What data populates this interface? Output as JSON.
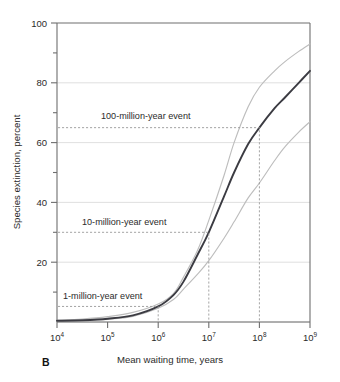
{
  "panel": {
    "label": "B"
  },
  "chart_data": {
    "type": "line",
    "title": "",
    "xlabel": "Mean waiting time, years",
    "ylabel": "Species extinction, percent",
    "xscale": "log",
    "xlim": [
      10000,
      1000000000
    ],
    "ylim": [
      0,
      100
    ],
    "grid": "horizontal-major",
    "legend": "none",
    "xticks": [
      {
        "value": 10000,
        "label": "10",
        "exponent": "4"
      },
      {
        "value": 100000,
        "label": "10",
        "exponent": "5"
      },
      {
        "value": 1000000,
        "label": "10",
        "exponent": "6"
      },
      {
        "value": 10000000,
        "label": "10",
        "exponent": "7"
      },
      {
        "value": 100000000,
        "label": "10",
        "exponent": "8"
      },
      {
        "value": 1000000000,
        "label": "10",
        "exponent": "9"
      }
    ],
    "yticks_major": [
      0,
      20,
      40,
      60,
      80,
      100
    ],
    "ytick_labels": [
      "",
      "20",
      "40",
      "60",
      "80",
      "100"
    ],
    "yticks_minor": [
      10,
      30,
      50,
      70,
      90
    ],
    "series": [
      {
        "name": "upper-bound",
        "style": "light-gray-thin",
        "color": "#bdbdbd",
        "x": [
          10000,
          31623,
          100000,
          316228,
          1000000,
          2000000,
          3162278,
          6000000,
          10000000,
          20000000,
          31622777,
          60000000,
          100000000,
          200000000,
          316227766,
          600000000,
          1000000000
        ],
        "y": [
          0.6,
          1.0,
          1.8,
          3.2,
          6.0,
          9.5,
          15.0,
          24.0,
          34.0,
          49.0,
          60.0,
          72.0,
          78.5,
          84.0,
          87.0,
          90.5,
          93.0
        ]
      },
      {
        "name": "best-estimate",
        "style": "dark-thick",
        "color": "#3b3b42",
        "x": [
          10000,
          31623,
          100000,
          316228,
          1000000,
          2000000,
          3162278,
          6000000,
          10000000,
          20000000,
          31622777,
          60000000,
          100000000,
          200000000,
          316227766,
          600000000,
          1000000000
        ],
        "y": [
          0.4,
          0.6,
          1.1,
          2.2,
          5.2,
          9.0,
          13.5,
          22.5,
          30.0,
          42.0,
          50.0,
          59.5,
          65.0,
          71.5,
          75.0,
          80.0,
          84.0
        ]
      },
      {
        "name": "lower-bound",
        "style": "light-gray-thin",
        "color": "#c6c6c6",
        "x": [
          10000,
          31623,
          100000,
          316228,
          1000000,
          2000000,
          3162278,
          6000000,
          10000000,
          20000000,
          31622777,
          60000000,
          100000000,
          200000000,
          316227766,
          600000000,
          1000000000
        ],
        "y": [
          0.3,
          0.5,
          0.9,
          1.9,
          4.6,
          7.5,
          11.0,
          16.0,
          20.5,
          28.0,
          33.5,
          41.5,
          46.5,
          54.0,
          58.5,
          63.5,
          67.0
        ]
      }
    ],
    "annotations": [
      {
        "name": "100-million-year-event",
        "text": "100-million-year event",
        "x": 100000000,
        "y": 65.0,
        "leader": "elbow-left-down"
      },
      {
        "name": "10-million-year-event",
        "text": "10-million-year event",
        "x": 10000000,
        "y": 30.0,
        "leader": "elbow-left-down"
      },
      {
        "name": "1-million-year-event",
        "text": "1-million-year event",
        "x": 1000000,
        "y": 5.2,
        "leader": "elbow-left-down"
      }
    ]
  },
  "colors": {
    "curve_main": "#3b3b42",
    "curve_band": "#bdbdbd",
    "grid": "#d8d8d8",
    "axis": "#6e6e6e",
    "leader": "#9a9a9a",
    "text": "#2b2b2b",
    "background": "#ffffff"
  }
}
